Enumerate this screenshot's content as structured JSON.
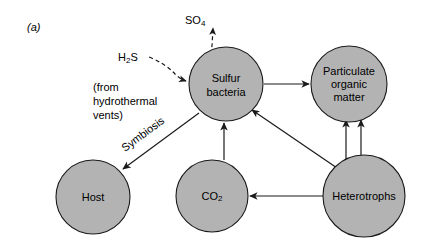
{
  "figure": {
    "panel_label": "(a)",
    "background_color": "#ffffff",
    "node_fill_color": "#b3b3b3",
    "node_stroke_color": "#1a1a1a",
    "text_color": "#000000"
  },
  "nodes": [
    {
      "id": "sulfur-bacteria",
      "lines": [
        "Sulfur",
        "bacteria"
      ],
      "cx": 226,
      "cy": 84,
      "r": 37
    },
    {
      "id": "particulate-organic-matter",
      "lines": [
        "Particulate",
        "organic",
        "matter"
      ],
      "cx": 349,
      "cy": 84,
      "r": 38
    },
    {
      "id": "host",
      "lines": [
        "Host"
      ],
      "cx": 93,
      "cy": 197,
      "r": 37
    },
    {
      "id": "co2",
      "lines": [
        "CO2"
      ],
      "label_main": "CO",
      "label_sub": "2",
      "cx": 212,
      "cy": 196,
      "r": 36
    },
    {
      "id": "heterotrophs",
      "lines": [
        "Heterotrophs"
      ],
      "cx": 364,
      "cy": 196,
      "r": 41
    }
  ],
  "labels": {
    "sulfate_output": "SO4",
    "sulfate_output_main": "SO",
    "sulfate_output_sub": "4",
    "sulfide_input_main": "H",
    "sulfide_input_sub": "2",
    "sulfide_input_tail": "S",
    "source_note_line1": "(from",
    "source_note_line2": "hydrothermal",
    "source_note_line3": "vents)",
    "symbiosis": "Symbiosis"
  },
  "edges": [
    {
      "id": "sulfate-out",
      "from": "sulfur-bacteria",
      "to": "SO4",
      "style": "dashed",
      "direction": "up"
    },
    {
      "id": "sulfide-in",
      "from": "H2S",
      "to": "sulfur-bacteria",
      "style": "dashed",
      "direction": "right"
    },
    {
      "id": "sulfur-to-pom",
      "from": "sulfur-bacteria",
      "to": "particulate-organic-matter",
      "style": "solid",
      "direction": "right"
    },
    {
      "id": "symbiosis-link",
      "from": "sulfur-bacteria",
      "to": "host",
      "style": "solid",
      "direction": "down-left",
      "label": "Symbiosis"
    },
    {
      "id": "co2-to-sulfur",
      "from": "co2",
      "to": "sulfur-bacteria",
      "style": "solid",
      "direction": "up"
    },
    {
      "id": "heterotrophs-to-sulfur",
      "from": "heterotrophs",
      "to": "sulfur-bacteria",
      "style": "solid",
      "direction": "up-left"
    },
    {
      "id": "heterotrophs-to-co2",
      "from": "heterotrophs",
      "to": "co2",
      "style": "solid",
      "direction": "left"
    },
    {
      "id": "heterotrophs-to-pom-a",
      "from": "heterotrophs",
      "to": "particulate-organic-matter",
      "style": "solid",
      "direction": "up"
    },
    {
      "id": "heterotrophs-to-pom-b",
      "from": "heterotrophs",
      "to": "particulate-organic-matter",
      "style": "solid",
      "direction": "up"
    }
  ]
}
